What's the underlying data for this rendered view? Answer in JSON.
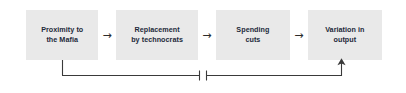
{
  "diagram": {
    "type": "flow-chain",
    "title": "",
    "nodes": [
      {
        "id": "proximity",
        "label": "Proximity to\nthe Mafia"
      },
      {
        "id": "replacement",
        "label": "Replacement\nby technocrats"
      },
      {
        "id": "spending",
        "label": "Spending\ncuts"
      },
      {
        "id": "variation",
        "label": "Variation in\noutput"
      }
    ],
    "connectors": [
      {
        "id": "arrow-1",
        "glyph": "→",
        "from": "proximity",
        "to": "replacement"
      },
      {
        "id": "arrow-2",
        "glyph": "→",
        "from": "replacement",
        "to": "spending"
      },
      {
        "id": "arrow-3",
        "glyph": "→",
        "from": "spending",
        "to": "variation"
      }
    ],
    "feedback": {
      "id": "feedback-bracket",
      "from": "proximity",
      "to": "variation",
      "label": "",
      "break_marker": true,
      "arrowhead": "up"
    },
    "colors": {
      "node_fill": "#e9e9e9",
      "node_text": "#1d2a3a",
      "arrow": "#2b2b2b",
      "line": "#3a3a3a",
      "background": "#ffffff"
    }
  }
}
